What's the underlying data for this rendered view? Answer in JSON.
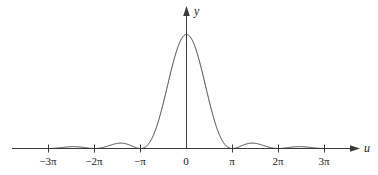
{
  "chart_data": {
    "type": "line",
    "title": "",
    "subtitle": "",
    "xlabel": "u",
    "ylabel": "y",
    "function": "(sin u / u)^2",
    "grid": false,
    "legend": null,
    "xlim": [
      -3.6666666667,
      3.9
    ],
    "ylim": [
      -0.08,
      1.18
    ],
    "xunit": "pi",
    "xticks": [
      -3,
      -2,
      -1,
      0,
      1,
      2,
      3
    ],
    "xtick_labels": [
      "−3π",
      "−2π",
      "−π",
      "0",
      "π",
      "2π",
      "3π"
    ],
    "yticks": [],
    "ytick_labels": [],
    "x": [
      -3.0,
      -2.9,
      -2.8,
      -2.7,
      -2.6,
      -2.5,
      -2.4,
      -2.3,
      -2.2,
      -2.1,
      -2.0,
      -1.9,
      -1.8,
      -1.7,
      -1.6,
      -1.5,
      -1.4,
      -1.3,
      -1.2,
      -1.1,
      -1.0,
      -0.9,
      -0.8,
      -0.7,
      -0.6,
      -0.5,
      -0.4,
      -0.3,
      -0.2,
      -0.1,
      0.0,
      0.1,
      0.2,
      0.3,
      0.4,
      0.5,
      0.6,
      0.7,
      0.8,
      0.9,
      1.0,
      1.1,
      1.2,
      1.3,
      1.4,
      1.5,
      1.6,
      1.7,
      1.8,
      1.9,
      2.0,
      2.1,
      2.2,
      2.3,
      2.4,
      2.5,
      2.6,
      2.7,
      2.8,
      2.9,
      3.0
    ],
    "y": [
      0.0,
      0.0011,
      0.0042,
      0.0087,
      0.0135,
      0.0172,
      0.0186,
      0.0171,
      0.0128,
      0.0068,
      0.0,
      0.0072,
      0.0267,
      0.0535,
      0.0802,
      0.0999,
      0.1079,
      0.1024,
      0.0848,
      0.0591,
      0.0,
      0.0656,
      0.2387,
      0.4694,
      0.6874,
      0.8488,
      0.9355,
      0.964,
      0.9869,
      0.9984,
      1.0,
      0.9984,
      0.9869,
      0.964,
      0.9355,
      0.8488,
      0.6874,
      0.4694,
      0.2387,
      0.0656,
      0.0,
      0.0591,
      0.0848,
      0.1024,
      0.1079,
      0.0999,
      0.0802,
      0.0535,
      0.0267,
      0.0072,
      0.0,
      0.0068,
      0.0128,
      0.0171,
      0.0186,
      0.0172,
      0.0135,
      0.0087,
      0.0042,
      0.0011,
      0.0
    ],
    "peaks": [
      {
        "x_pi": 0,
        "y": 1.0
      },
      {
        "x_pi": 1.43,
        "y": 0.0472
      },
      {
        "x_pi": -1.43,
        "y": 0.0472
      },
      {
        "x_pi": 2.46,
        "y": 0.0165
      },
      {
        "x_pi": -2.46,
        "y": 0.0165
      }
    ],
    "zeros_pi": [
      -3,
      -2,
      -1,
      1,
      2,
      3
    ],
    "line_color": "#3a3a3a",
    "axis_color": "#3a3a3a",
    "background_color": "#ffffff"
  },
  "axes": {
    "x_axis_label": "u",
    "y_axis_label": "y",
    "x_tick_labels": [
      "−3π",
      "−2π",
      "−π",
      "0",
      "π",
      "2π",
      "3π"
    ]
  },
  "ticks": [
    {
      "label": "−3π",
      "x": 48
    },
    {
      "label": "−2π",
      "x": 94
    },
    {
      "label": "−π",
      "x": 140
    },
    {
      "label": "0",
      "x": 186
    },
    {
      "label": "π",
      "x": 232
    },
    {
      "label": "2π",
      "x": 278
    },
    {
      "label": "3π",
      "x": 324
    }
  ]
}
